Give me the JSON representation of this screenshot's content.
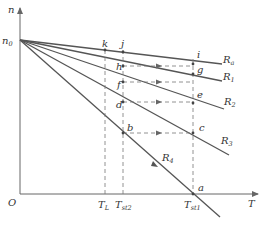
{
  "diagram": {
    "type": "motor speed-torque characteristics with resistance steps",
    "axes": {
      "y_label": "n",
      "x_label": "T",
      "origin_label": "O",
      "y_intercept_label": "n0"
    },
    "torque_ticks": [
      {
        "label": "T",
        "sub": "L"
      },
      {
        "label": "T",
        "sub": "st2"
      },
      {
        "label": "T",
        "sub": "st1"
      }
    ],
    "curves": [
      {
        "label": "R",
        "sub": "a"
      },
      {
        "label": "R",
        "sub": "1"
      },
      {
        "label": "R",
        "sub": "2"
      },
      {
        "label": "R",
        "sub": "3"
      },
      {
        "label": "R",
        "sub": "4"
      }
    ],
    "points": [
      "a",
      "b",
      "c",
      "d",
      "e",
      "f",
      "g",
      "h",
      "i",
      "j",
      "k"
    ]
  }
}
